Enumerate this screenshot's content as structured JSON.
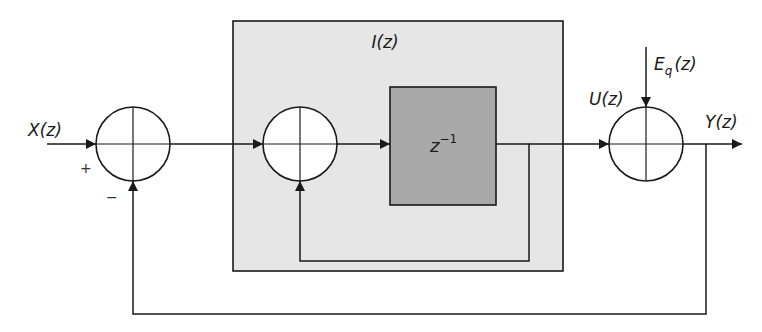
{
  "diagram": {
    "type": "block-diagram",
    "colors": {
      "line": "#1a1a1a",
      "integrator_box_fill": "#e6e6e6",
      "delay_block_fill": "#a9a9a9",
      "background": "#ffffff"
    },
    "signals": {
      "input": "X(z)",
      "integrator": "I(z)",
      "integrator_output": "U(z)",
      "noise": "E",
      "noise_subscript": "q",
      "noise_suffix": "(z)",
      "output": "Y(z)"
    },
    "blocks": {
      "delay": {
        "base": "z",
        "exponent": "−1"
      }
    },
    "summing_junctions": [
      {
        "id": "sum-input",
        "signs": {
          "left": "+",
          "bottom": "−"
        }
      },
      {
        "id": "sum-integrator",
        "signs": {}
      },
      {
        "id": "sum-noise",
        "signs": {}
      }
    ]
  }
}
